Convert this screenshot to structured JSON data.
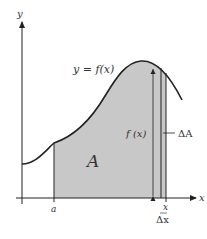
{
  "diagram": {
    "labels": {
      "y_axis": "y",
      "x_axis": "x",
      "curve": "y = f(x)",
      "area": "A",
      "a_point": "a",
      "x_point": "x",
      "height": "f (x)",
      "delta_area": "ΔA",
      "delta_x": "Δx"
    },
    "colors": {
      "fill": "#c8c8c8",
      "stroke": "#222222",
      "text": "#333333",
      "background": "#ffffff"
    }
  }
}
